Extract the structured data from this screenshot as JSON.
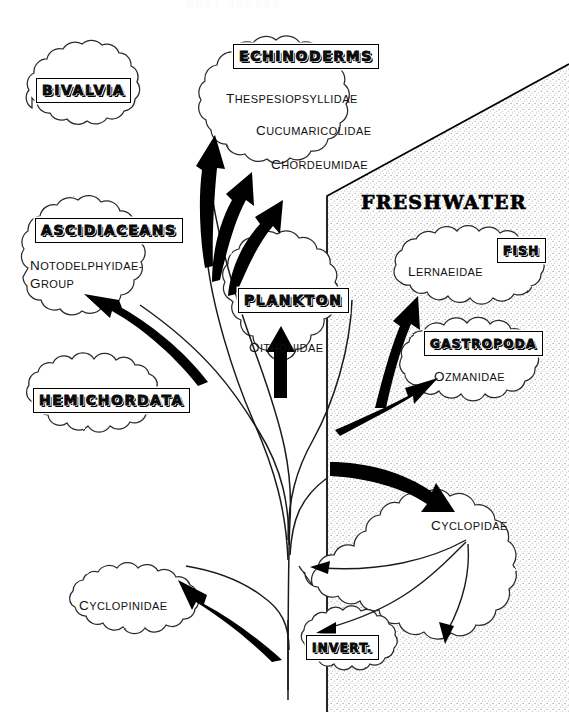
{
  "diagram": {
    "title_faint": "HOST GROUPS",
    "region_label": "FRESHWATER",
    "background_color": "#ffffff",
    "ink_color": "#000000",
    "stipple_color": "#8a8a8a"
  },
  "bubbles": [
    {
      "id": "bivalvia",
      "header": "BIVALVIA",
      "families": [],
      "habitat": "marine"
    },
    {
      "id": "echinoderms",
      "header": "ECHINODERMS",
      "families": [
        "Thespesiopsyllidae",
        "Cucumaricolidae",
        "Chordeumidae"
      ],
      "habitat": "marine"
    },
    {
      "id": "ascidiaceans",
      "header": "ASCIDIACEANS",
      "families": [
        "Notodelphyidae-",
        "group"
      ],
      "habitat": "marine"
    },
    {
      "id": "hemichordata",
      "header": "HEMICHORDATA",
      "families": [],
      "habitat": "marine"
    },
    {
      "id": "plankton",
      "header": "PLANKTON",
      "families": [
        "Oithonidae"
      ],
      "habitat": "marine"
    },
    {
      "id": "fish",
      "header": "FISH",
      "families": [
        "Lernaeidae"
      ],
      "habitat": "freshwater"
    },
    {
      "id": "gastropoda",
      "header": "GASTROPODA",
      "families": [
        "Ozmanidae"
      ],
      "habitat": "freshwater"
    },
    {
      "id": "cyclopidae",
      "header": "",
      "families": [
        "Cyclopidae"
      ],
      "habitat": "freshwater"
    },
    {
      "id": "invert",
      "header": "INVERT.",
      "families": [],
      "habitat": "freshwater"
    },
    {
      "id": "cyclopinidae",
      "header": "",
      "families": [
        "Cyclopinidae"
      ],
      "habitat": "marine"
    }
  ],
  "labels": {
    "bivalvia": "BIVALVIA",
    "echinoderms": "ECHINODERMS",
    "thespesiopsyllidae": "Thespesiopsyllidae",
    "cucumaricolidae": "Cucumaricolidae",
    "chordeumidae": "Chordeumidae",
    "ascidiaceans": "ASCIDIACEANS",
    "notodelphyidae_1": "Notodelphyidae-",
    "notodelphyidae_2": "group",
    "hemichordata": "HEMICHORDATA",
    "plankton": "PLANKTON",
    "oithonidae": "Oithonidae",
    "freshwater": "FRESHWATER",
    "fish": "FISH",
    "lernaeidae": "Lernaeidae",
    "gastropoda": "GASTROPODA",
    "ozmanidae": "Ozmanidae",
    "cyclopidae": "Cyclopidae",
    "invert": "INVERT.",
    "cyclopinidae": "Cyclopinidae"
  },
  "arrows": [
    {
      "from": "trunk",
      "to": "echinoderms-thespesiopsyllidae",
      "style": "thick-curved"
    },
    {
      "from": "trunk",
      "to": "echinoderms-cucumaricolidae",
      "style": "thick-curved"
    },
    {
      "from": "trunk",
      "to": "echinoderms-chordeumidae",
      "style": "thick-curved"
    },
    {
      "from": "trunk",
      "to": "ascidiaceans",
      "style": "thick-curved"
    },
    {
      "from": "trunk",
      "to": "plankton",
      "style": "thick-straight"
    },
    {
      "from": "trunk",
      "to": "fish",
      "style": "thick-curved"
    },
    {
      "from": "trunk",
      "to": "gastropoda",
      "style": "thick-curved"
    },
    {
      "from": "trunk",
      "to": "cyclopidae",
      "style": "thick-curved"
    },
    {
      "from": "trunk",
      "to": "cyclopinidae",
      "style": "thick-curved"
    },
    {
      "from": "cyclopidae",
      "to": "left-host",
      "style": "thin"
    },
    {
      "from": "cyclopidae",
      "to": "invert",
      "style": "thin"
    },
    {
      "from": "cyclopidae",
      "to": "down",
      "style": "thin"
    }
  ]
}
